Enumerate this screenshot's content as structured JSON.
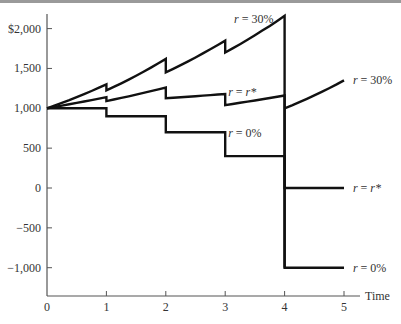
{
  "chart_data": {
    "type": "line",
    "title": "",
    "xlabel": "Time",
    "ylabel": "",
    "xlim": [
      0,
      5
    ],
    "ylim": [
      -1300,
      2200
    ],
    "grid": false,
    "x_ticks": [
      "0",
      "1",
      "2",
      "3",
      "4",
      "5"
    ],
    "y_ticks": [
      "$2,000",
      "1,500",
      "1,000",
      "500",
      "0",
      "-500",
      "-1,000"
    ],
    "y_tick_values": [
      2000,
      1500,
      1000,
      500,
      0,
      -500,
      -1000
    ],
    "series": [
      {
        "name": "r = 30%",
        "points": [
          [
            0,
            1000
          ],
          [
            1,
            1300
          ],
          [
            1,
            1225
          ],
          [
            2,
            1620
          ],
          [
            2,
            1450
          ],
          [
            3,
            1850
          ],
          [
            3,
            1700
          ],
          [
            4,
            2160
          ],
          [
            4,
            -1000
          ]
        ],
        "after": [
          [
            4,
            1000
          ],
          [
            5,
            1350
          ]
        ],
        "labels": [
          {
            "text": "r = 30%",
            "x": 3.15,
            "y": 2120
          },
          {
            "text": "r = 30%",
            "x": 5.15,
            "y": 1350
          }
        ]
      },
      {
        "name": "r = r*",
        "points": [
          [
            0,
            1000
          ],
          [
            1,
            1140
          ],
          [
            1,
            1090
          ],
          [
            2,
            1260
          ],
          [
            2,
            1125
          ],
          [
            3,
            1180
          ],
          [
            3,
            1040
          ],
          [
            4,
            1160
          ],
          [
            4,
            0
          ],
          [
            5,
            0
          ]
        ],
        "labels": [
          {
            "text": "r = r*",
            "x": 3.05,
            "y": 1200
          },
          {
            "text": "r = r*",
            "x": 5.15,
            "y": 0
          }
        ]
      },
      {
        "name": "r = 0%",
        "points": [
          [
            0,
            1000
          ],
          [
            1,
            1000
          ],
          [
            1,
            900
          ],
          [
            2,
            900
          ],
          [
            2,
            700
          ],
          [
            3,
            700
          ],
          [
            3,
            400
          ],
          [
            4,
            400
          ],
          [
            4,
            -1000
          ],
          [
            5,
            -1000
          ]
        ],
        "labels": [
          {
            "text": "r = 0%",
            "x": 3.05,
            "y": 690
          },
          {
            "text": "r = 0%",
            "x": 5.15,
            "y": -1000
          }
        ]
      }
    ],
    "legend": "inline labels"
  }
}
